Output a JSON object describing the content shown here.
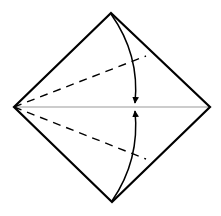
{
  "diagram": {
    "type": "origami-fold",
    "colors": {
      "background": "#ffffff",
      "outline": "#000000",
      "crease": "#999999",
      "fold_line": "#000000",
      "arrow": "#000000"
    },
    "square": {
      "top": [
        111,
        13
      ],
      "right": [
        210,
        107
      ],
      "bottom": [
        112,
        202
      ],
      "left": [
        14,
        107
      ]
    },
    "center_crease": {
      "from": [
        14,
        107
      ],
      "to": [
        210,
        107
      ]
    },
    "valley_folds": [
      {
        "from": [
          14,
          107
        ],
        "to": [
          146,
          56
        ]
      },
      {
        "from": [
          14,
          107
        ],
        "to": [
          146,
          159
        ]
      }
    ],
    "arrows": [
      {
        "from": [
          111,
          14
        ],
        "ctrl": [
          140,
          55
        ],
        "to": [
          135,
          103
        ],
        "direction": "down"
      },
      {
        "from": [
          112,
          201
        ],
        "ctrl": [
          140,
          160
        ],
        "to": [
          135,
          111
        ],
        "direction": "up"
      }
    ]
  }
}
